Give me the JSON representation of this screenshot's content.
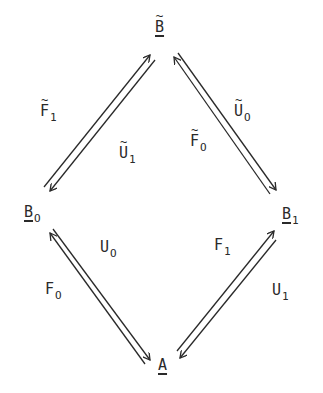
{
  "diagram": {
    "type": "commutative-diamond",
    "nodes": {
      "top": {
        "letter": "B",
        "tilde": "~",
        "subscript": "",
        "underlined": true
      },
      "left": {
        "letter": "B",
        "tilde": "",
        "subscript": "O",
        "underlined": true
      },
      "right": {
        "letter": "B",
        "tilde": "",
        "subscript": "1",
        "underlined": true
      },
      "bottom": {
        "letter": "A",
        "tilde": "",
        "subscript": "",
        "underlined": true
      }
    },
    "edges": [
      {
        "id": "F1-tilde",
        "letter": "F",
        "tilde": "~",
        "subscript": "1",
        "from": "left",
        "to": "top"
      },
      {
        "id": "U1-tilde",
        "letter": "U",
        "tilde": "~",
        "subscript": "1",
        "from": "top",
        "to": "left"
      },
      {
        "id": "F0-tilde",
        "letter": "F",
        "tilde": "~",
        "subscript": "O",
        "from": "right",
        "to": "top"
      },
      {
        "id": "U0-tilde",
        "letter": "U",
        "tilde": "~",
        "subscript": "O",
        "from": "top",
        "to": "right"
      },
      {
        "id": "F0",
        "letter": "F",
        "tilde": "",
        "subscript": "O",
        "from": "bottom",
        "to": "left"
      },
      {
        "id": "U0",
        "letter": "U",
        "tilde": "",
        "subscript": "O",
        "from": "left",
        "to": "bottom"
      },
      {
        "id": "F1",
        "letter": "F",
        "tilde": "",
        "subscript": "1",
        "from": "bottom",
        "to": "right"
      },
      {
        "id": "U1",
        "letter": "U",
        "tilde": "",
        "subscript": "1",
        "from": "right",
        "to": "bottom"
      }
    ]
  },
  "colors": {
    "ink": "#2a2a2a",
    "background": "#ffffff"
  }
}
